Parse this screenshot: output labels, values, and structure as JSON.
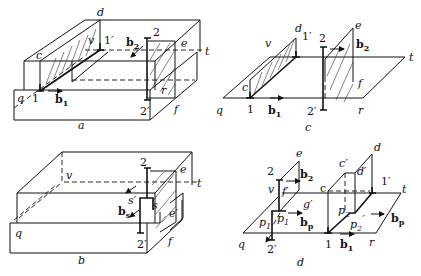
{
  "figure": {
    "panels": [
      {
        "id": "a",
        "caption": "a",
        "labels": {
          "d": "d",
          "v": "v",
          "one_prime": "1′",
          "two": "2",
          "b2": "b",
          "b2_sub": "2",
          "e": "e",
          "t": "t",
          "c": "c",
          "q": "q",
          "one": "1",
          "b1": "b",
          "b1_sub": "1",
          "r": "r",
          "two_prime": "2′",
          "f": "f"
        }
      },
      {
        "id": "c",
        "caption": "c",
        "labels": {
          "d": "d",
          "v": "v",
          "one_prime": "1′",
          "two": "2",
          "e": "e",
          "b2": "b",
          "b2_sub": "2",
          "t": "t",
          "c": "c",
          "f": "f",
          "q": "q",
          "one": "1",
          "b1": "b",
          "b1_sub": "1",
          "two_prime": "2′",
          "r": "r"
        }
      },
      {
        "id": "b",
        "caption": "b",
        "labels": {
          "two": "2",
          "e": "e",
          "v": "v",
          "t": "t",
          "s_prime": "s′",
          "s": "s",
          "bs": "b",
          "bs_sub": "s",
          "e_prime": "e′",
          "q": "q",
          "two_prime": "2′",
          "f": "f"
        }
      },
      {
        "id": "d",
        "caption": "d",
        "labels": {
          "e": "e",
          "d": "d",
          "two": "2",
          "b2": "b",
          "b2_sub": "2",
          "c_prime": "c′",
          "d_prime": "d′",
          "v": "v",
          "f_prime": "f′",
          "c": "c",
          "one_prime": "1′",
          "t": "t",
          "g_prime": "g′",
          "p2": "p",
          "p2_sub": "2",
          "p1_prime": "p",
          "p1_prime_sub": "1",
          "p1_prime_mark": "′",
          "p1": "p",
          "p1_sub": "1",
          "bp_left": "b",
          "bp_left_sub": "p",
          "p2_prime": "p",
          "p2_prime_sub": "2",
          "p2_prime_mark": "′",
          "bp_right": "b",
          "bp_right_sub": "p",
          "q": "q",
          "two_prime": "2′",
          "one": "1",
          "b1": "b",
          "b1_sub": "1",
          "r": "r"
        }
      }
    ]
  }
}
